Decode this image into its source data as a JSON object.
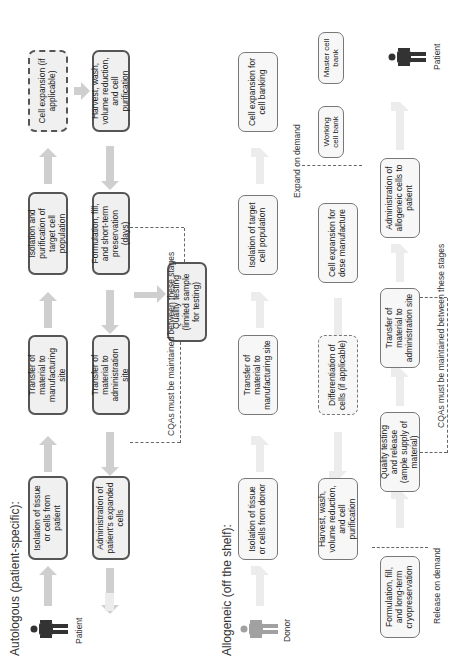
{
  "autologous": {
    "title": "Autologous (patient-specific):",
    "patient_label": "Patient",
    "boxes": {
      "isolation_tissue": "Isolation of tissue or cells from patient",
      "transfer_mfg": "Transfer of material to manufacturing site",
      "isolation_purification": "Isolation and purification of target cell population",
      "cell_expansion": "Cell expansion (if applicable)",
      "harvest": "Harvest, wash, volume reduction, and cell purification",
      "formulation": "Formulation, fill, and short-term preservation (days)",
      "transfer_admin": "Transfer of material to administration site",
      "administration": "Administration of patient's expanded cells",
      "quality_testing": "Quality testing (limited sample for testing)"
    },
    "cqa_note": "CQAs must be maintained between these stages"
  },
  "allogeneic": {
    "title": "Allogeneic (off the shelf):",
    "donor_label": "Donor",
    "patient_label": "Patient",
    "boxes": {
      "isolation_tissue": "Isolation of tissue or cells from donor",
      "transfer_mfg": "Transfer of material to manufacturing site",
      "isolation_target": "Isolation of target cell population",
      "cell_expansion_banking": "Cell expansion for cell banking",
      "master_bank": "Master cell bank",
      "working_bank": "Working cell bank",
      "cell_expansion_dose": "Cell expansion for dose manufacture",
      "differentiation": "Differentiation of cells (if applicable)",
      "harvest": "Harvest, wash, volume reduction, and cell purification",
      "formulation": "Formulation, fill, and long-term cryopreservation",
      "quality_testing": "Quality testing and release (ample supply of material)",
      "transfer_admin": "Transfer of material to administration site",
      "administration": "Administration of allogeneic cells to patient"
    },
    "expand_label": "Expand on demand",
    "release_label": "Release on demand",
    "cqa_note": "CQAs must be maintained between these stages"
  }
}
